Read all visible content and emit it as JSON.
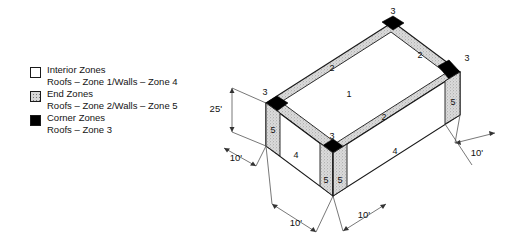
{
  "figure": {
    "legend": {
      "entries": [
        {
          "swatch": "interior-zone-swatch",
          "swatch_style": "white",
          "color": "#ffffff",
          "line1": "Interior Zones",
          "line2": "Roofs – Zone 1/Walls – Zone 4"
        },
        {
          "swatch": "end-zone-swatch",
          "swatch_style": "stippled",
          "color": "#d8d8d8",
          "line1": "End Zones",
          "line2": "Roofs – Zone 2/Walls – Zone 5"
        },
        {
          "swatch": "corner-zone-swatch",
          "swatch_style": "black",
          "color": "#000000",
          "line1": "Corner Zones",
          "line2": "Roofs – Zone 3"
        }
      ]
    },
    "zone_labels": {
      "roof_interior": "1",
      "roof_end_left": "2",
      "roof_end_right": "2",
      "roof_end_front": "2",
      "roof_corner_top": "3",
      "roof_corner_right": "3",
      "roof_corner_left": "3",
      "roof_corner_front": "3",
      "wall_left_interior": "4",
      "wall_right_interior": "4",
      "wall_left_end": "5",
      "wall_front_end_a": "5",
      "wall_front_end_b": "5",
      "wall_right_end": "5"
    },
    "dimensions": {
      "height": "25'",
      "left_edge": "10'",
      "bottom_left": "10'",
      "bottom_right": "10'",
      "right_edge": "10'"
    },
    "colors": {
      "interior": "#ffffff",
      "end": "#d8d8d8",
      "corner": "#000000",
      "outline": "#1a1a1a",
      "dimension_line": "#555555"
    }
  }
}
